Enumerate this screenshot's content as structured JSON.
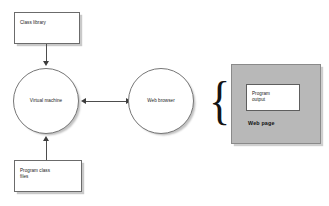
{
  "diagram": {
    "background_color": "#ffffff",
    "nodes": {
      "class_library": {
        "label": "Class library",
        "shape": "rectangle"
      },
      "program_class_files": {
        "label": "Program class\nfiles",
        "shape": "rectangle"
      },
      "virtual_machine": {
        "label": "Virtual machine",
        "shape": "circle"
      },
      "web_browser": {
        "label": "Web browser",
        "shape": "circle"
      },
      "program_output": {
        "label": "Program\noutput",
        "shape": "rectangle",
        "fill": "#ffffff"
      },
      "web_page": {
        "label": "Web page",
        "shape": "rectangle",
        "fill": "#b8b8b8"
      }
    },
    "brace": {
      "glyph": "{"
    },
    "connectors": [
      {
        "name": "class-library-to-virtual-machine",
        "from": "class_library",
        "to": "virtual_machine",
        "direction": "down",
        "arrowheads": 1
      },
      {
        "name": "program-class-files-to-virtual-machine",
        "from": "program_class_files",
        "to": "virtual_machine",
        "direction": "up",
        "arrowheads": 1
      },
      {
        "name": "virtual-machine-to-web-browser",
        "from": "virtual_machine",
        "to": "web_browser",
        "direction": "bidirectional",
        "arrowheads": 2
      }
    ],
    "colors": {
      "stroke": "#4d4d4d",
      "shadow": "#c9c9c9",
      "panel_fill": "#b8b8b8",
      "text": "#1a1a1a"
    }
  }
}
